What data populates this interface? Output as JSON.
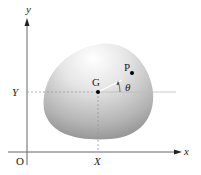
{
  "diagram": {
    "title": "",
    "axes": {
      "x_label": "x",
      "y_label": "y",
      "origin_label": "O"
    },
    "centroid": {
      "label": "G",
      "x_coord_label": "X",
      "y_coord_label": "Y"
    },
    "point": {
      "label": "P"
    },
    "angle": {
      "label": "θ"
    },
    "colors": {
      "axis": "#555555",
      "guide": "#9a9a9a",
      "body_light": "#ffffff",
      "body_dark": "#8a8a8a",
      "point": "#000000"
    }
  }
}
